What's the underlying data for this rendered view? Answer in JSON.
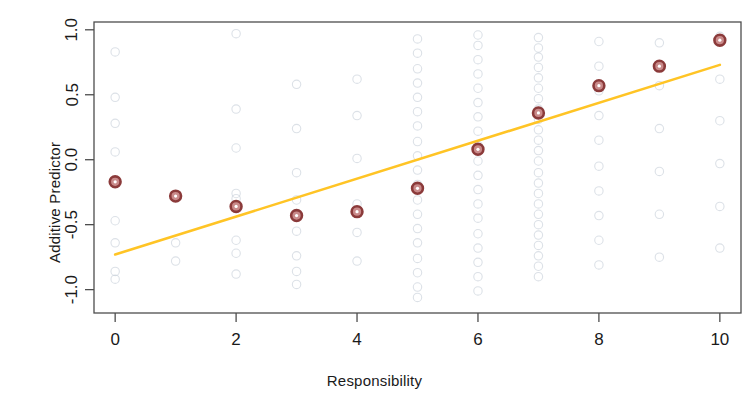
{
  "chart_data": {
    "type": "scatter",
    "title": "",
    "subtitle": "",
    "xlabel": "Responsibility",
    "ylabel": "Additive Predictor",
    "xlim": [
      -0.35,
      10.35
    ],
    "ylim": [
      -1.18,
      1.06
    ],
    "xticks": [
      0,
      2,
      4,
      6,
      8,
      10
    ],
    "xtick_labels": [
      "0",
      "2",
      "4",
      "6",
      "8",
      "10"
    ],
    "yticks": [
      -1.0,
      -0.5,
      0.0,
      0.5,
      1.0
    ],
    "ytick_labels": [
      "-1.0",
      "-0.5",
      "0.0",
      "0.5",
      "1.0"
    ],
    "grid": false,
    "legend": "none",
    "colors": {
      "marker": "#8B3A3A",
      "marker_fill": "#C98A8A",
      "line": "#FFC425",
      "background_points": "#BFC8D4",
      "axis": "#4d4d4d",
      "text": "#1a1a1a"
    },
    "series": [
      {
        "name": "Mean additive predictor",
        "type": "scatter",
        "marker": "open-circle",
        "color": "#8B3A3A",
        "x": [
          0,
          1,
          2,
          3,
          4,
          5,
          6,
          7,
          8,
          9,
          10
        ],
        "values": [
          -0.17,
          -0.28,
          -0.36,
          -0.43,
          -0.4,
          -0.22,
          0.08,
          0.36,
          0.57,
          0.72,
          0.92
        ]
      },
      {
        "name": "Fitted linear trend",
        "type": "line",
        "color": "#FFC425",
        "x": [
          0,
          10
        ],
        "values": [
          -0.73,
          0.73
        ]
      },
      {
        "name": "Observed responses (jittered)",
        "type": "scatter",
        "marker": "open-circle-faint",
        "color": "#BFC8D4",
        "points": [
          [
            0,
            0.83
          ],
          [
            0,
            0.48
          ],
          [
            0,
            0.28
          ],
          [
            0,
            0.06
          ],
          [
            0,
            -0.47
          ],
          [
            0,
            -0.64
          ],
          [
            0,
            -0.86
          ],
          [
            0,
            -0.92
          ],
          [
            1,
            -0.64
          ],
          [
            1,
            -0.78
          ],
          [
            2,
            0.97
          ],
          [
            2,
            0.39
          ],
          [
            2,
            0.09
          ],
          [
            2,
            -0.26
          ],
          [
            2,
            -0.3
          ],
          [
            2,
            -0.62
          ],
          [
            2,
            -0.72
          ],
          [
            2,
            -0.88
          ],
          [
            3,
            0.58
          ],
          [
            3,
            0.24
          ],
          [
            3,
            -0.1
          ],
          [
            3,
            -0.31
          ],
          [
            3,
            -0.55
          ],
          [
            3,
            -0.74
          ],
          [
            3,
            -0.86
          ],
          [
            3,
            -0.96
          ],
          [
            4,
            0.62
          ],
          [
            4,
            0.34
          ],
          [
            4,
            0.01
          ],
          [
            4,
            -0.34
          ],
          [
            4,
            -0.56
          ],
          [
            4,
            -0.78
          ],
          [
            5,
            0.93
          ],
          [
            5,
            0.82
          ],
          [
            5,
            0.7
          ],
          [
            5,
            0.59
          ],
          [
            5,
            0.48
          ],
          [
            5,
            0.37
          ],
          [
            5,
            0.26
          ],
          [
            5,
            0.14
          ],
          [
            5,
            0.03
          ],
          [
            5,
            -0.08
          ],
          [
            5,
            -0.19
          ],
          [
            5,
            -0.31
          ],
          [
            5,
            -0.42
          ],
          [
            5,
            -0.53
          ],
          [
            5,
            -0.64
          ],
          [
            5,
            -0.76
          ],
          [
            5,
            -0.87
          ],
          [
            5,
            -0.98
          ],
          [
            5,
            -1.06
          ],
          [
            6,
            0.96
          ],
          [
            6,
            0.88
          ],
          [
            6,
            0.77
          ],
          [
            6,
            0.66
          ],
          [
            6,
            0.55
          ],
          [
            6,
            0.44
          ],
          [
            6,
            0.33
          ],
          [
            6,
            0.22
          ],
          [
            6,
            0.11
          ],
          [
            6,
            -0.01
          ],
          [
            6,
            -0.12
          ],
          [
            6,
            -0.23
          ],
          [
            6,
            -0.34
          ],
          [
            6,
            -0.45
          ],
          [
            6,
            -0.57
          ],
          [
            6,
            -0.68
          ],
          [
            6,
            -0.79
          ],
          [
            6,
            -0.9
          ],
          [
            6,
            -1.01
          ],
          [
            7,
            0.94
          ],
          [
            7,
            0.86
          ],
          [
            7,
            0.79
          ],
          [
            7,
            0.71
          ],
          [
            7,
            0.63
          ],
          [
            7,
            0.55
          ],
          [
            7,
            0.47
          ],
          [
            7,
            0.39
          ],
          [
            7,
            0.31
          ],
          [
            7,
            0.23
          ],
          [
            7,
            0.15
          ],
          [
            7,
            0.07
          ],
          [
            7,
            -0.01
          ],
          [
            7,
            -0.1
          ],
          [
            7,
            -0.18
          ],
          [
            7,
            -0.26
          ],
          [
            7,
            -0.34
          ],
          [
            7,
            -0.42
          ],
          [
            7,
            -0.5
          ],
          [
            7,
            -0.58
          ],
          [
            7,
            -0.66
          ],
          [
            7,
            -0.74
          ],
          [
            7,
            -0.82
          ],
          [
            7,
            -0.9
          ],
          [
            8,
            0.91
          ],
          [
            8,
            0.72
          ],
          [
            8,
            0.53
          ],
          [
            8,
            0.34
          ],
          [
            8,
            0.15
          ],
          [
            8,
            -0.05
          ],
          [
            8,
            -0.24
          ],
          [
            8,
            -0.43
          ],
          [
            8,
            -0.62
          ],
          [
            8,
            -0.81
          ],
          [
            9,
            0.9
          ],
          [
            9,
            0.57
          ],
          [
            9,
            0.24
          ],
          [
            9,
            -0.09
          ],
          [
            9,
            -0.42
          ],
          [
            9,
            -0.75
          ],
          [
            10,
            0.95
          ],
          [
            10,
            0.62
          ],
          [
            10,
            0.3
          ],
          [
            10,
            -0.03
          ],
          [
            10,
            -0.36
          ],
          [
            10,
            -0.68
          ]
        ]
      }
    ]
  }
}
